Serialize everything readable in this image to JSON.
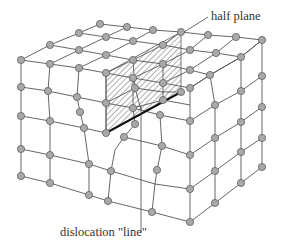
{
  "figure": {
    "labels": {
      "half_plane": "half plane",
      "dislocation_line": "dislocation \"line\""
    },
    "colors": {
      "atom_fill": "#a9a9a9",
      "atom_stroke": "#5f5f5f",
      "bond": "#555555",
      "hatch": "#555555",
      "dislocation_line": "#111111"
    }
  }
}
